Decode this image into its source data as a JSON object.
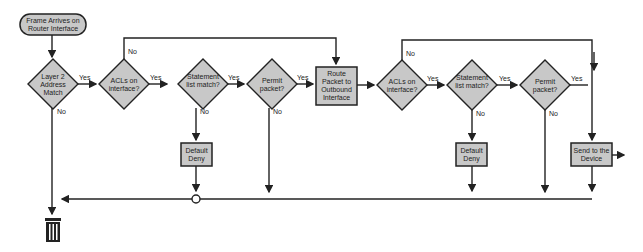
{
  "diagram": {
    "start": {
      "label": "Frame Arrives on Router Interface"
    },
    "nodes": [
      {
        "id": "d1",
        "type": "decision",
        "label": "Layer 2 Address Match"
      },
      {
        "id": "d2",
        "type": "decision",
        "label": "ACLs on interface?"
      },
      {
        "id": "d3",
        "type": "decision",
        "label": "Statement list match?"
      },
      {
        "id": "d4",
        "type": "decision",
        "label": "Permit packet?"
      },
      {
        "id": "p1",
        "type": "process",
        "label": "Route Packet to Outbound Interface"
      },
      {
        "id": "d5",
        "type": "decision",
        "label": "ACLs on interface?"
      },
      {
        "id": "d6",
        "type": "decision",
        "label": "Statement list match?"
      },
      {
        "id": "d7",
        "type": "decision",
        "label": "Permit packet?"
      },
      {
        "id": "p2",
        "type": "process",
        "label": "Send to the Device"
      },
      {
        "id": "deny1",
        "type": "process",
        "label": "Default Deny"
      },
      {
        "id": "deny2",
        "type": "process",
        "label": "Default Deny"
      }
    ],
    "edge_labels": {
      "yes": "Yes",
      "no": "No"
    },
    "end": {
      "icon": "trash-can-icon"
    },
    "colors": {
      "fill": "#c8c8c8",
      "stroke": "#222222",
      "background": "#ffffff"
    }
  }
}
